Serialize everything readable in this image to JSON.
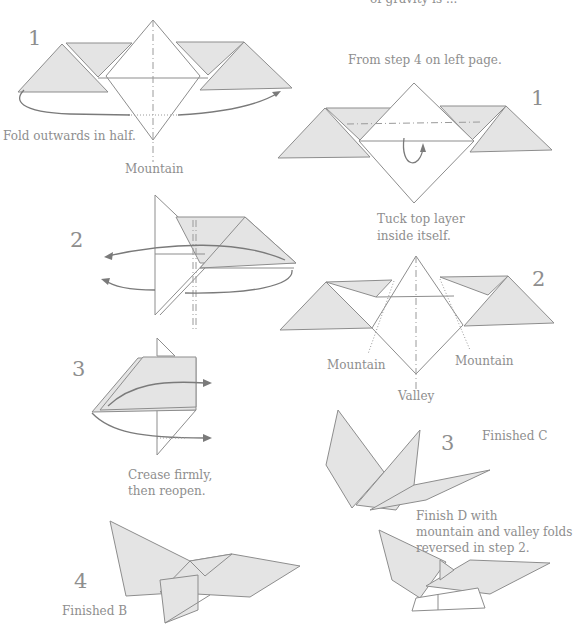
{
  "page": {
    "top_fragment": "of gravity is ..."
  },
  "left_column": {
    "steps": [
      {
        "number": "1",
        "caption": "Fold outwards in half.",
        "label": "Mountain"
      },
      {
        "number": "2"
      },
      {
        "number": "3",
        "caption_line1": "Crease firmly,",
        "caption_line2": "then reopen."
      },
      {
        "number": "4",
        "caption": "Finished B"
      }
    ]
  },
  "right_column": {
    "intro": "From step 4 on left page.",
    "steps": [
      {
        "number": "1",
        "caption_line1": "Tuck top layer",
        "caption_line2": "inside itself."
      },
      {
        "number": "2",
        "label_left": "Mountain",
        "label_right": "Mountain",
        "label_bottom": "Valley"
      },
      {
        "number": "3",
        "caption": "Finished C",
        "note_line1": "Finish D with",
        "note_line2": "mountain and valley folds",
        "note_line3": "reversed in step 2."
      }
    ]
  },
  "colors": {
    "paper_fill": "#e4e4e4",
    "line": "#8d8d8d",
    "text": "#8e8e8e"
  }
}
